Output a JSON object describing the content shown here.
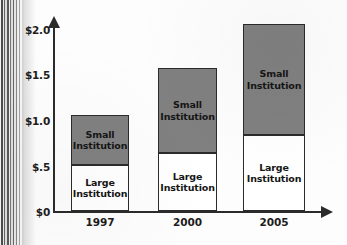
{
  "chart_data": {
    "type": "bar",
    "subtype": "stacked-bar",
    "title": "",
    "xlabel": "",
    "ylabel": "",
    "categories": [
      "1997",
      "2000",
      "2005"
    ],
    "series": [
      {
        "name": "Large Institution",
        "values": [
          0.51,
          0.63,
          0.84
        ],
        "color": "#ffffff"
      },
      {
        "name": "Small Institution",
        "values": [
          0.55,
          0.94,
          1.21
        ],
        "color": "#808080"
      }
    ],
    "totals": [
      1.06,
      1.57,
      2.05
    ],
    "ylim": [
      0,
      2.2
    ],
    "yticks": [
      0,
      0.5,
      1.0,
      1.5,
      2.0
    ],
    "ytick_labels": [
      "$0",
      "$.5",
      "$1.0",
      "$1.5",
      "$2.0"
    ],
    "xtick_labels": [
      "1997",
      "2000",
      "2005"
    ],
    "grid": false,
    "legend": "none",
    "segment_labels": {
      "small": "Small\nInstitution",
      "large": "Large\nInstitution"
    },
    "axis_color": "#2b2b2b",
    "bar_outline_color": "#2b2b2b"
  },
  "axis": {
    "y_ticks": [
      {
        "label": "$2.0",
        "value": 2.0,
        "top": 25
      },
      {
        "label": "$1.5",
        "value": 1.5,
        "top": 70
      },
      {
        "label": "$1.0",
        "value": 1.0,
        "top": 116
      },
      {
        "label": "$.5",
        "value": 0.5,
        "top": 162
      },
      {
        "label": "$0",
        "value": 0,
        "top": 207
      }
    ]
  },
  "bars": [
    {
      "category": "1997",
      "left": 71,
      "width": 58,
      "total_height": 96,
      "small_height": 50,
      "large_height": 46,
      "small_label": "Small\nInstitution",
      "large_label": "Large\nInstitution",
      "xtick_left": 71,
      "xtick_width": 58
    },
    {
      "category": "2000",
      "left": 158,
      "width": 59,
      "total_height": 143,
      "small_height": 85,
      "large_height": 58,
      "small_label": "Small\nInstitution",
      "large_label": "Large\nInstitution",
      "xtick_left": 158,
      "xtick_width": 59
    },
    {
      "category": "2005",
      "left": 243,
      "width": 62,
      "total_height": 187,
      "small_height": 111,
      "large_height": 76,
      "small_label": "Small\nInstitution",
      "large_label": "Large\nInstitution",
      "xtick_left": 243,
      "xtick_width": 62
    }
  ]
}
